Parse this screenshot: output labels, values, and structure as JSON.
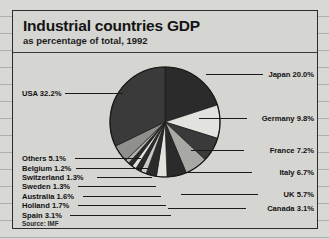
{
  "panel": {
    "title": "Industrial countries GDP",
    "subtitle": "as percentage of total, 1992",
    "source": "Source: IMF"
  },
  "chart_data": {
    "type": "pie",
    "title": "Industrial countries GDP",
    "subtitle": "as percentage of total, 1992",
    "unit": "%",
    "source": "Source: IMF",
    "legend_position": "callout-labels",
    "total": 100.0,
    "categories": [
      "USA",
      "Japan",
      "Germany",
      "France",
      "Italy",
      "UK",
      "Canada",
      "Spain",
      "Holland",
      "Australia",
      "Sweden",
      "Switzerland",
      "Belgium",
      "Others"
    ],
    "values": [
      32.2,
      20.0,
      9.8,
      7.2,
      6.7,
      5.7,
      3.1,
      3.1,
      1.7,
      1.6,
      1.3,
      1.3,
      1.2,
      5.1
    ],
    "slices": [
      {
        "name": "Japan",
        "value": 20.0,
        "label": "Japan 20.0%",
        "color": "#2b2b2b",
        "side": "right"
      },
      {
        "name": "Germany",
        "value": 9.8,
        "label": "Germany 9.8%",
        "color": "#e2e2df",
        "side": "right"
      },
      {
        "name": "France",
        "value": 7.2,
        "label": "France 7.2%",
        "color": "#3a3a3a",
        "side": "right"
      },
      {
        "name": "Italy",
        "value": 6.7,
        "label": "Italy 6.7%",
        "color": "#a8a8a4",
        "side": "right"
      },
      {
        "name": "UK",
        "value": 5.7,
        "label": "UK 5.7%",
        "color": "#2b2b2b",
        "side": "right"
      },
      {
        "name": "Canada",
        "value": 3.1,
        "label": "Canada 3.1%",
        "color": "#e2e2df",
        "side": "right"
      },
      {
        "name": "Spain",
        "value": 3.1,
        "label": "Spain 3.1%",
        "color": "#2b2b2b",
        "side": "left"
      },
      {
        "name": "Holland",
        "value": 1.7,
        "label": "Holland 1.7%",
        "color": "#c9c9c5",
        "side": "left"
      },
      {
        "name": "Australia",
        "value": 1.6,
        "label": "Australia 1.6%",
        "color": "#2b2b2b",
        "side": "left"
      },
      {
        "name": "Sweden",
        "value": 1.3,
        "label": "Sweden 1.3%",
        "color": "#e2e2df",
        "side": "left"
      },
      {
        "name": "Switzerland",
        "value": 1.3,
        "label": "Switzerland 1.3%",
        "color": "#2b2b2b",
        "side": "left"
      },
      {
        "name": "Belgium",
        "value": 1.2,
        "label": "Belgium 1.2%",
        "color": "#b5b5b1",
        "side": "left"
      },
      {
        "name": "Others",
        "value": 5.1,
        "label": "Others 5.1%",
        "color": "#8f8f8b",
        "side": "left"
      },
      {
        "name": "USA",
        "value": 32.2,
        "label": "USA 32.2%",
        "color": "#3a3a3a",
        "side": "left"
      }
    ]
  },
  "labels": {
    "japan": "Japan 20.0%",
    "germany": "Germany 9.8%",
    "france": "France 7.2%",
    "italy": "Italy 6.7%",
    "uk": "UK 5.7%",
    "canada": "Canada 3.1%",
    "usa": "USA 32.2%",
    "others": "Others 5.1%",
    "belgium": "Belgium 1.2%",
    "switzerland": "Switzerland 1.3%",
    "sweden": "Sweden 1.3%",
    "australia": "Australia 1.6%",
    "holland": "Holland 1.7%",
    "spain": "Spain 3.1%"
  }
}
